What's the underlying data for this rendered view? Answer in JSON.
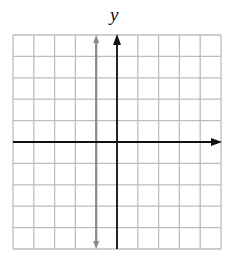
{
  "chart_data": {
    "type": "line",
    "title": "",
    "xlabel": "",
    "ylabel": "y",
    "xlim": [
      -5,
      5
    ],
    "ylim": [
      -5,
      5
    ],
    "grid": true,
    "grid_step": 1,
    "axes": {
      "x_axis_arrow": "right",
      "y_axis_arrow": "up"
    },
    "series": [
      {
        "name": "x = -1",
        "kind": "vertical_line",
        "x": -1,
        "color": "#8a8a8a",
        "arrows": "both"
      }
    ]
  },
  "colors": {
    "grid": "#bdbdbd",
    "axis": "#111111",
    "line": "#8a8a8a"
  }
}
